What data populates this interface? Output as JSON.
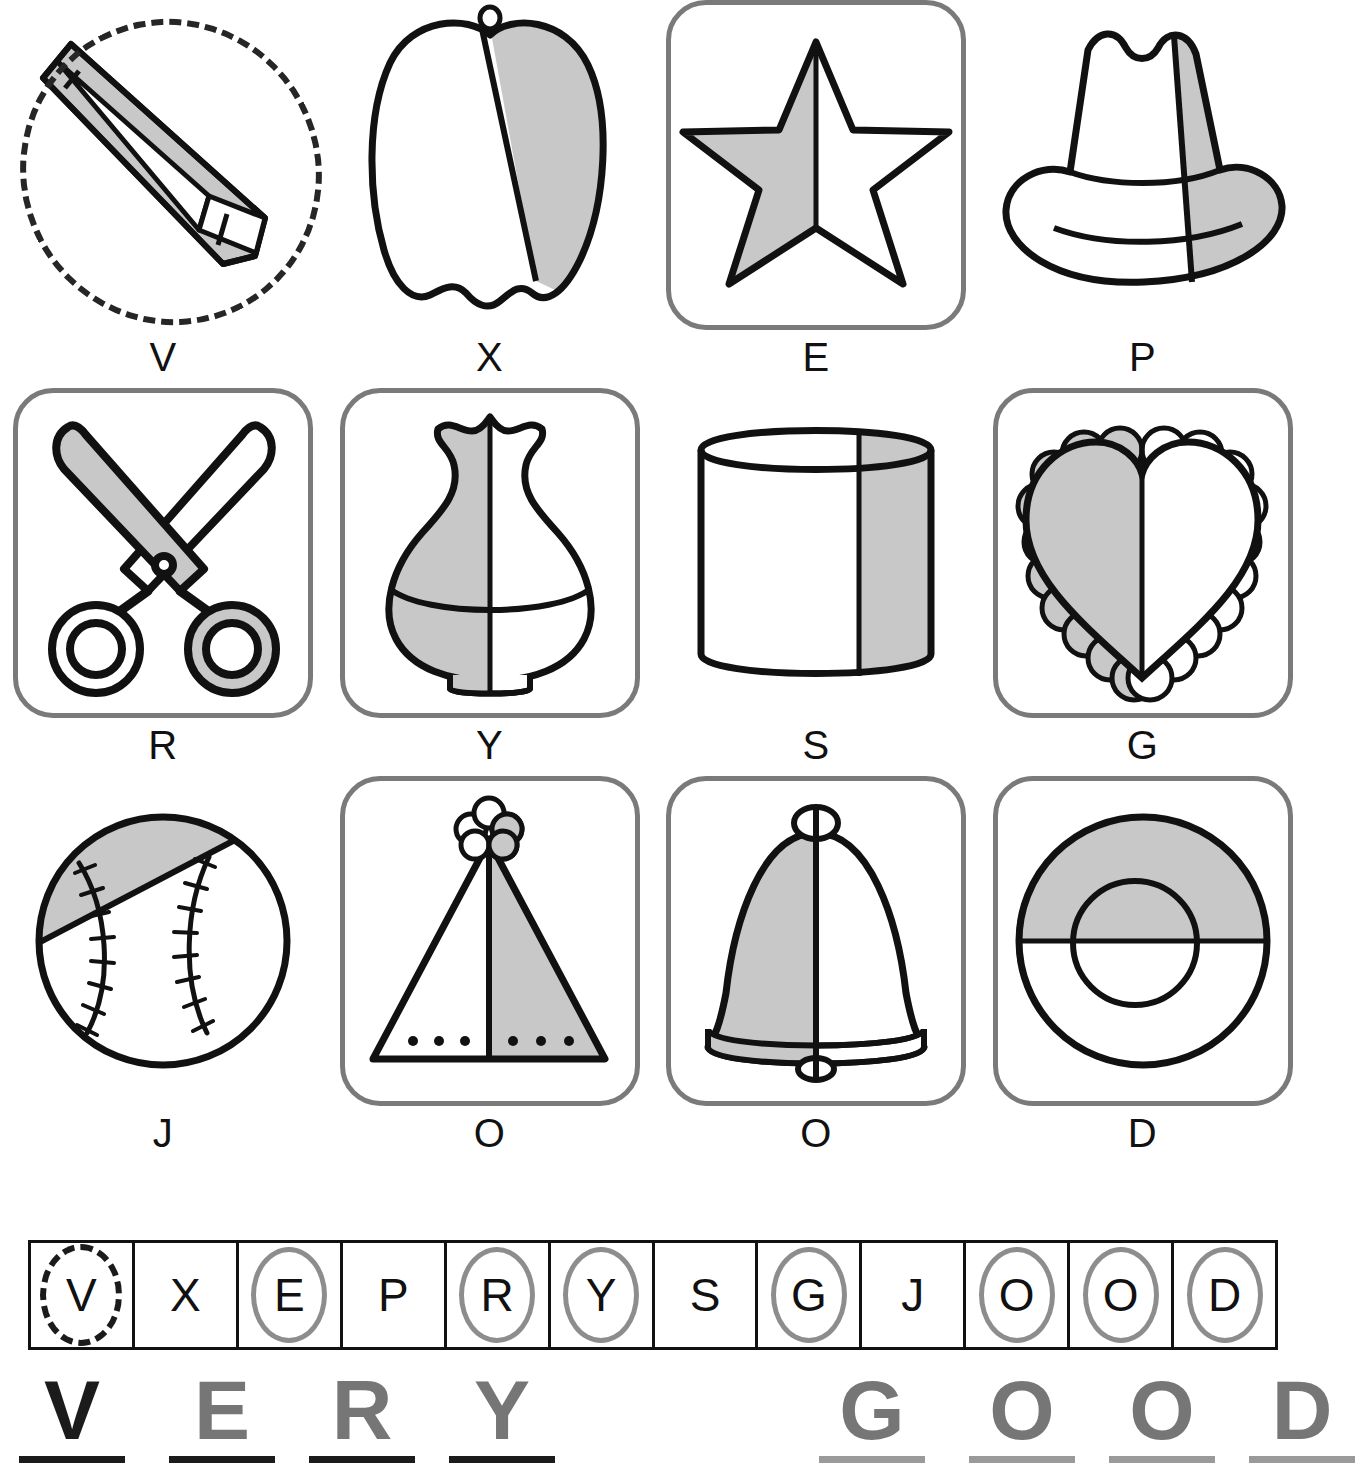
{
  "worksheet": {
    "type": "symmetry-worksheet",
    "instruction_partial_cutoff": "",
    "shade_color": "#c8c8c8",
    "frame_color": "#7a7a7a",
    "ink_color": "#111111",
    "circle_color": "#8d8d8d"
  },
  "items": [
    {
      "letter": "V",
      "object": "crayon",
      "framed": false,
      "selected": true,
      "selection_style": "dashed-ellipse",
      "shaded_part": "diagonal-lower-half",
      "symmetric": false
    },
    {
      "letter": "X",
      "object": "bell-pepper",
      "framed": false,
      "selected": false,
      "shaded_part": "right-slanted-part",
      "symmetric": false
    },
    {
      "letter": "E",
      "object": "star",
      "framed": true,
      "selected": true,
      "shaded_part": "left-half",
      "symmetric": true
    },
    {
      "letter": "P",
      "object": "cowboy-hat",
      "framed": false,
      "selected": false,
      "shaded_part": "right-side-strip",
      "symmetric": false
    },
    {
      "letter": "R",
      "object": "scissors",
      "framed": true,
      "selected": true,
      "shaded_part": "one-blade-and-handle",
      "symmetric": true
    },
    {
      "letter": "Y",
      "object": "vase",
      "framed": true,
      "selected": true,
      "shaded_part": "left-half",
      "symmetric": true
    },
    {
      "letter": "S",
      "object": "cylinder",
      "framed": false,
      "selected": false,
      "shaded_part": "right-side-strip",
      "symmetric": false
    },
    {
      "letter": "G",
      "object": "lace-heart",
      "framed": true,
      "selected": true,
      "shaded_part": "left-half",
      "symmetric": true
    },
    {
      "letter": "J",
      "object": "baseball",
      "framed": false,
      "selected": false,
      "shaded_part": "top-left-diagonal-segment",
      "symmetric": false
    },
    {
      "letter": "O",
      "object": "party-hat-tree",
      "framed": true,
      "selected": true,
      "shaded_part": "right-half",
      "symmetric": true
    },
    {
      "letter": "O",
      "object": "bell",
      "framed": true,
      "selected": true,
      "shaded_part": "left-half",
      "symmetric": true
    },
    {
      "letter": "D",
      "object": "donut-ring",
      "framed": true,
      "selected": true,
      "shaded_part": "top-half",
      "symmetric": true
    }
  ],
  "answer_strip": {
    "name": "answer-letter-strip",
    "boxes": [
      {
        "letter": "V",
        "circled": true,
        "circle_style": "dashed"
      },
      {
        "letter": "X",
        "circled": false,
        "circle_style": "none"
      },
      {
        "letter": "E",
        "circled": true,
        "circle_style": "solid"
      },
      {
        "letter": "P",
        "circled": false,
        "circle_style": "none"
      },
      {
        "letter": "R",
        "circled": true,
        "circle_style": "solid"
      },
      {
        "letter": "Y",
        "circled": true,
        "circle_style": "solid"
      },
      {
        "letter": "S",
        "circled": false,
        "circle_style": "none"
      },
      {
        "letter": "G",
        "circled": true,
        "circle_style": "solid"
      },
      {
        "letter": "J",
        "circled": false,
        "circle_style": "none"
      },
      {
        "letter": "O",
        "circled": true,
        "circle_style": "solid"
      },
      {
        "letter": "O",
        "circled": true,
        "circle_style": "solid"
      },
      {
        "letter": "D",
        "circled": true,
        "circle_style": "solid"
      }
    ]
  },
  "secret_message": {
    "name": "very-good-message",
    "text": "VERY GOOD",
    "letters": [
      {
        "char": "V",
        "x": 72,
        "color": "#1b1b1b",
        "underline_width": 106,
        "underline_color": "#1b1b1b"
      },
      {
        "char": "E",
        "x": 222,
        "color": "#767676",
        "underline_width": 106,
        "underline_color": "#1b1b1b"
      },
      {
        "char": "R",
        "x": 362,
        "color": "#767676",
        "underline_width": 106,
        "underline_color": "#1b1b1b"
      },
      {
        "char": "Y",
        "x": 502,
        "color": "#767676",
        "underline_width": 106,
        "underline_color": "#1b1b1b"
      },
      {
        "char": "G",
        "x": 872,
        "color": "#767676",
        "underline_width": 106,
        "underline_color": "#9a9a9a"
      },
      {
        "char": "O",
        "x": 1022,
        "color": "#767676",
        "underline_width": 106,
        "underline_color": "#9a9a9a"
      },
      {
        "char": "O",
        "x": 1162,
        "color": "#767676",
        "underline_width": 106,
        "underline_color": "#9a9a9a"
      },
      {
        "char": "D",
        "x": 1302,
        "color": "#767676",
        "underline_width": 106,
        "underline_color": "#9a9a9a"
      }
    ]
  }
}
